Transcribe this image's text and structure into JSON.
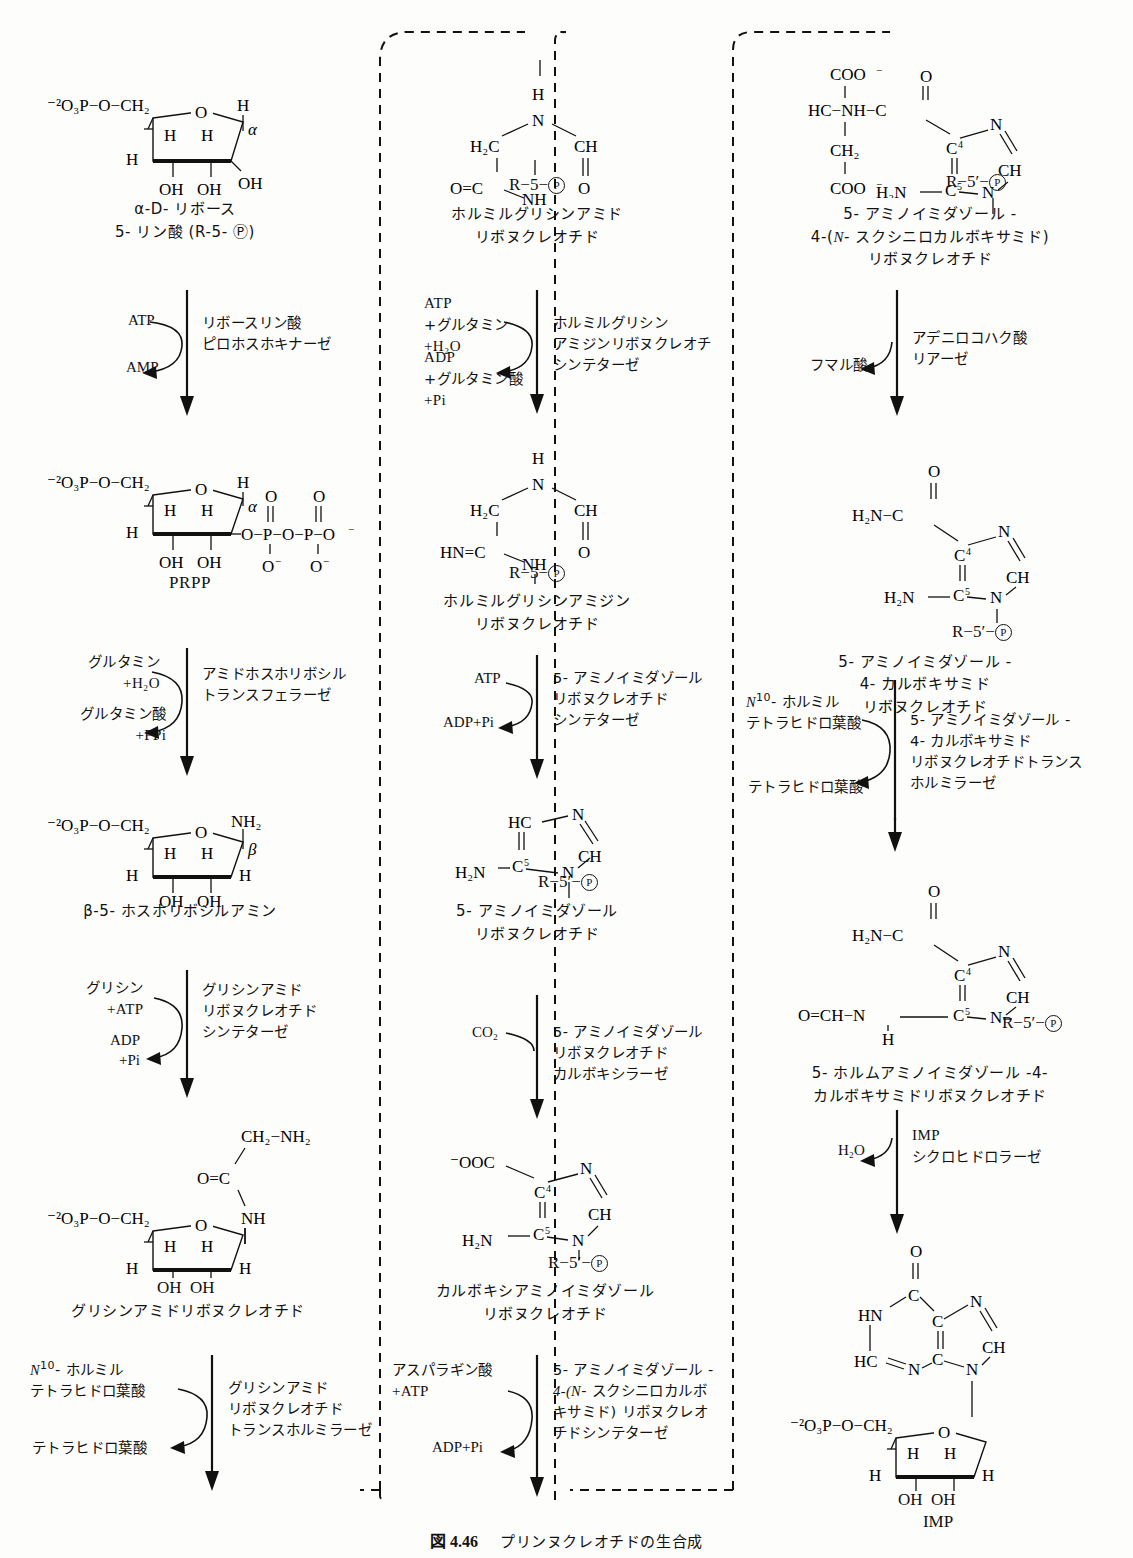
{
  "figure": {
    "number": "図 4.46",
    "title": "プリンヌクレオチドの生合成"
  },
  "columns": [
    {
      "id": "left",
      "compounds": [
        {
          "id": "r5p",
          "name_lines": [
            "α-D- リボース",
            "5- リン酸 (R-5- Ⓟ)"
          ],
          "structure": "ribose-5-phosphate"
        },
        {
          "id": "prpp",
          "name_lines": [
            "PRPP"
          ],
          "structure": "prpp"
        },
        {
          "id": "pra",
          "name_lines": [
            "β-5- ホスホリボシルアミン"
          ],
          "structure": "phosphoribosylamine"
        },
        {
          "id": "gar",
          "name_lines": [
            "グリシンアミドリボヌクレオチド"
          ],
          "structure": "glycinamide-ribonucleotide"
        }
      ],
      "reactions": [
        {
          "id": "ribose-phosphate-pyrophosphokinase",
          "substrates": [
            "ATP"
          ],
          "products": [
            "AMP"
          ],
          "enzyme_lines": [
            "リボースリン酸",
            "ピロホスホキナーゼ"
          ]
        },
        {
          "id": "amidophosphoribosyltransferase",
          "substrates": [
            "グルタミン",
            "+H₂O"
          ],
          "products": [
            "グルタミン酸",
            "+PPi"
          ],
          "enzyme_lines": [
            "アミドホスホリボシル",
            "トランスフェラーゼ"
          ]
        },
        {
          "id": "glycinamide-ribonucleotide-synthetase",
          "substrates": [
            "グリシン",
            "+ATP"
          ],
          "products": [
            "ADP",
            "+Pi"
          ],
          "enzyme_lines": [
            "グリシンアミド",
            "リボヌクレオチド",
            "シンテターゼ"
          ]
        },
        {
          "id": "glycinamide-ribonucleotide-transformylase",
          "substrates": [
            "N¹⁰- ホルミル",
            "テトラヒドロ葉酸"
          ],
          "products": [
            "テトラヒドロ葉酸"
          ],
          "enzyme_lines": [
            "グリシンアミド",
            "リボヌクレオチド",
            "トランスホルミラーゼ"
          ]
        }
      ]
    },
    {
      "id": "middle",
      "compounds": [
        {
          "id": "fgar",
          "name_lines": [
            "ホルミルグリシンアミド",
            "リボヌクレオチド"
          ],
          "structure": "fgar"
        },
        {
          "id": "fgam",
          "name_lines": [
            "ホルミルグリシンアミジン",
            "リボヌクレオチド"
          ],
          "structure": "fgam"
        },
        {
          "id": "air",
          "name_lines": [
            "5- アミノイミダゾール",
            "リボヌクレオチド"
          ],
          "structure": "air"
        },
        {
          "id": "cair",
          "name_lines": [
            "カルボキシアミノイミダゾール",
            "リボヌクレオチド"
          ],
          "structure": "cair"
        }
      ],
      "reactions": [
        {
          "id": "fgam-synthetase",
          "substrates": [
            "ATP",
            "+グルタミン",
            "+H₂O"
          ],
          "products": [
            "ADP",
            "+グルタミン酸",
            "+Pi"
          ],
          "enzyme_lines": [
            "ホルミルグリシン",
            "アミジンリボヌクレオチ",
            "シンテターゼ"
          ]
        },
        {
          "id": "air-synthetase",
          "substrates": [
            "ATP"
          ],
          "products": [
            "ADP+Pi"
          ],
          "enzyme_lines": [
            "5- アミノイミダゾール",
            "リボヌクレオチド",
            "シンテターゼ"
          ]
        },
        {
          "id": "air-carboxylase",
          "substrates": [
            "CO₂"
          ],
          "products": [],
          "enzyme_lines": [
            "5- アミノイミダゾール",
            "リボヌクレオチド",
            "カルボキシラーゼ"
          ]
        },
        {
          "id": "saicar-synthetase",
          "substrates": [
            "アスパラギン酸",
            "+ATP"
          ],
          "products": [
            "ADP+Pi"
          ],
          "enzyme_lines": [
            "5- アミノイミダゾール -",
            "4-(N- スクシニロカルボ",
            "キサミド) リボヌクレオ",
            "チドシンテターゼ"
          ]
        }
      ]
    },
    {
      "id": "right",
      "compounds": [
        {
          "id": "saicar",
          "name_lines": [
            "5- アミノイミダゾール -",
            "4-(N- スクシニロカルボキサミド)",
            "リボヌクレオチド"
          ],
          "structure": "saicar"
        },
        {
          "id": "aicar",
          "name_lines": [
            "5- アミノイミダゾール -",
            "4- カルボキサミド",
            "リボヌクレオチド"
          ],
          "structure": "aicar"
        },
        {
          "id": "faicar",
          "name_lines": [
            "5- ホルムアミノイミダゾール -4-",
            "カルボキサミドリボヌクレオチド"
          ],
          "structure": "faicar"
        },
        {
          "id": "imp",
          "name_lines": [
            "IMP"
          ],
          "structure": "imp"
        }
      ],
      "reactions": [
        {
          "id": "adenylosuccinate-lyase",
          "substrates": [],
          "products": [
            "フマル酸"
          ],
          "enzyme_lines": [
            "アデニロコハク酸",
            "リアーゼ"
          ]
        },
        {
          "id": "aicar-transformylase",
          "substrates": [
            "N¹⁰- ホルミル",
            "テトラヒドロ葉酸"
          ],
          "products": [
            "テトラヒドロ葉酸"
          ],
          "enzyme_lines": [
            "5- アミノイミダゾール -",
            "4- カルボキサミド",
            "リボヌクレオチドトランス",
            "ホルミラーゼ"
          ]
        },
        {
          "id": "imp-cyclohydrolase",
          "substrates": [],
          "products": [
            "H₂O"
          ],
          "enzyme_lines": [
            "IMP",
            "シクロヒドロラーゼ"
          ]
        }
      ]
    }
  ],
  "atoms": {
    "phosphate_left": "⁻²O₃P−O−CH₂",
    "r5p_tag": "R−5−Ⓟ",
    "r5prime_tag": "R−5′−Ⓟ",
    "oh": "OH",
    "h": "H",
    "nh2": "NH₂",
    "h2n": "H₂N",
    "ch": "CH",
    "hc": "HC",
    "n": "N",
    "nh": "NH",
    "hn": "HN",
    "o": "O",
    "c": "C",
    "ooc": "⁻OOC",
    "coo": "COO⁻",
    "ch2": "CH₂",
    "h2c": "H₂C",
    "alpha": "α",
    "beta": "β",
    "c4": "C₄",
    "c5": "C₅",
    "prpp_tail": "O−P−O−P−O⁻"
  }
}
